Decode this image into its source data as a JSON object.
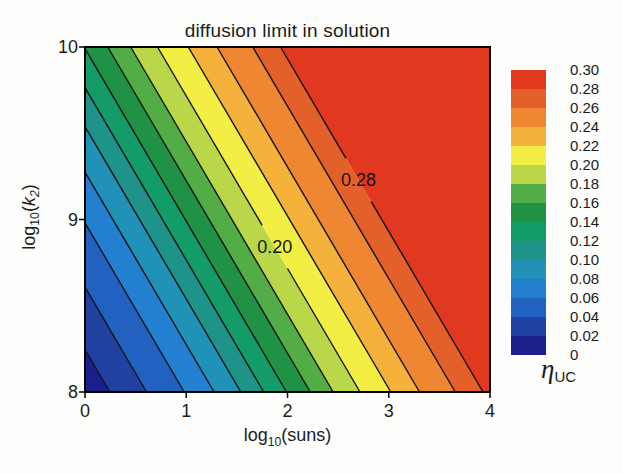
{
  "figure": {
    "background": "#fdfdfb"
  },
  "chart_data": {
    "type": "contour",
    "title": "diffusion limit in solution",
    "xlabel": "log10(suns)",
    "ylabel": "log10(k2)",
    "xlabel_parts": {
      "pre": "log",
      "sub": "10",
      "post": "(suns)"
    },
    "ylabel_parts": {
      "pre": "log",
      "sub": "10",
      "open": "(",
      "var": "k",
      "varsub": "2",
      "close": ")"
    },
    "xlim": [
      0,
      4
    ],
    "ylim": [
      8,
      10
    ],
    "x_ticks": [
      "0",
      "1",
      "2",
      "3",
      "4"
    ],
    "x_tick_values": [
      0,
      1,
      2,
      3,
      4
    ],
    "y_ticks": [
      "8",
      "9",
      "10"
    ],
    "y_tick_values": [
      8,
      9,
      10
    ],
    "grid": false,
    "levels": [
      0.02,
      0.04,
      0.06,
      0.08,
      0.1,
      0.12,
      0.14,
      0.16,
      0.18,
      0.2,
      0.22,
      0.24,
      0.26,
      0.28
    ],
    "band_colors": [
      "#1a1f8c",
      "#20419f",
      "#2162c0",
      "#2380d0",
      "#2092b8",
      "#1d9389",
      "#149c68",
      "#1f9246",
      "#52ad47",
      "#bad74a",
      "#f2ee44",
      "#f4b23c",
      "#ee8632",
      "#e4602a",
      "#e0391f"
    ],
    "contour_line_color": "#111111",
    "contour_geometry": {
      "description": "contour lines are straight with slope dy/dx = -1 in data units; eta increases toward upper right",
      "slope_dy_dx": -1,
      "x_intercepts_at_y8": [
        0.245,
        0.608,
        0.98,
        1.275,
        1.539,
        1.765,
        1.99,
        2.225,
        2.451,
        2.716,
        3.02,
        3.304,
        3.657,
        3.931
      ]
    },
    "inline_labels": [
      {
        "text": "0.20",
        "level": 0.2,
        "x": 1.875,
        "y": 8.841
      },
      {
        "text": "0.28",
        "level": 0.28,
        "x": 2.702,
        "y": 9.229
      }
    ],
    "colorbar": {
      "tick_labels_top_to_bottom": [
        "0.30",
        "0.28",
        "0.26",
        "0.24",
        "0.22",
        "0.20",
        "0.18",
        "0.16",
        "0.14",
        "0.12",
        "0.10",
        "0.08",
        "0.06",
        "0.04",
        "0.02",
        "0"
      ],
      "label_main": "η",
      "label_sub": "UC"
    }
  }
}
